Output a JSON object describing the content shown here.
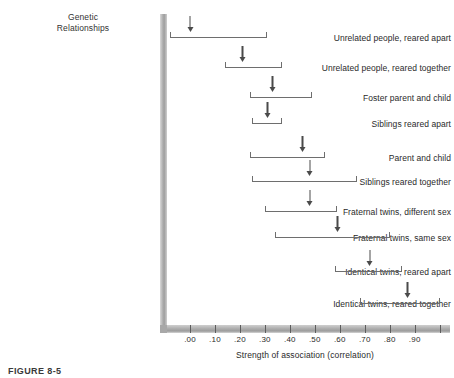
{
  "figure": {
    "caption": "FIGURE 8-5",
    "column_header_line1": "Genetic",
    "column_header_line2": "Relationships"
  },
  "chart_data": {
    "type": "bar",
    "title": "",
    "xlabel": "Strength of association (correlation)",
    "ylabel": "Genetic Relationships",
    "xlim": [
      -0.12,
      1.04
    ],
    "grid": false,
    "legend": null,
    "tick_labels": [
      ".00",
      ".10",
      ".20",
      ".30",
      ".40",
      ".50",
      ".60",
      ".70",
      ".80",
      ".90"
    ],
    "tick_values": [
      0.0,
      0.1,
      0.2,
      0.3,
      0.4,
      0.5,
      0.6,
      0.7,
      0.8,
      0.9
    ],
    "categories": [
      "Unrelated people, reared apart",
      "Unrelated people, reared together",
      "Foster parent and child",
      "Siblings reared apart",
      "Parent and child",
      "Siblings reared together",
      "Fraternal twins, different sex",
      "Fraternal twins, same sex",
      "Identical twins, reared apart",
      "Identical twins, reared together"
    ],
    "series": [
      {
        "name": "Range of correlations (bracket)",
        "low": [
          -0.08,
          0.14,
          0.24,
          0.25,
          0.24,
          0.25,
          0.3,
          0.34,
          0.58,
          0.68
        ],
        "high": [
          0.31,
          0.37,
          0.49,
          0.37,
          0.54,
          0.67,
          0.59,
          0.8,
          0.85,
          1.0
        ]
      },
      {
        "name": "Median correlation (arrow)",
        "values": [
          0.0,
          0.21,
          0.33,
          0.31,
          0.45,
          0.48,
          0.48,
          0.59,
          0.72,
          0.87
        ]
      }
    ]
  },
  "rows": [
    {
      "label": "Unrelated people, reared apart",
      "low": -0.08,
      "high": 0.31,
      "median": 0.0
    },
    {
      "label": "Unrelated people, reared together",
      "low": 0.14,
      "high": 0.37,
      "median": 0.21
    },
    {
      "label": "Foster parent and child",
      "low": 0.24,
      "high": 0.49,
      "median": 0.33
    },
    {
      "label": "Siblings reared apart",
      "low": 0.25,
      "high": 0.37,
      "median": 0.31
    },
    {
      "label": "Parent and child",
      "low": 0.24,
      "high": 0.54,
      "median": 0.45
    },
    {
      "label": "Siblings reared together",
      "low": 0.25,
      "high": 0.67,
      "median": 0.48
    },
    {
      "label": "Fraternal twins, different sex",
      "low": 0.3,
      "high": 0.59,
      "median": 0.48
    },
    {
      "label": "Fraternal twins, same sex",
      "low": 0.34,
      "high": 0.8,
      "median": 0.59
    },
    {
      "label": "Identical twins, reared apart",
      "low": 0.58,
      "high": 0.85,
      "median": 0.72
    },
    {
      "label": "Identical twins, reared together",
      "low": 0.68,
      "high": 1.0,
      "median": 0.87
    }
  ]
}
